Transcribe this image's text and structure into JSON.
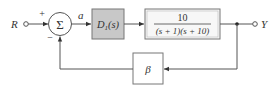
{
  "diagram": {
    "type": "block-diagram",
    "input_label": "R",
    "output_label": "Y",
    "summing_junction": {
      "symbol": "Σ",
      "plus_sign": "+",
      "minus_sign": "−"
    },
    "signal_a_label": "a",
    "controller": {
      "label_main": "D",
      "label_sub": "1",
      "label_arg": "(s)",
      "fill": "#c8c8c8"
    },
    "plant": {
      "numerator": "10",
      "denominator": "(s + 1)(s + 10)",
      "fill": "#f7f7f7"
    },
    "feedback": {
      "label": "β"
    },
    "colors": {
      "line": "#555555",
      "text": "#333333",
      "controller_fill": "#c8c8c8",
      "plant_fill": "#f7f7f7"
    }
  }
}
